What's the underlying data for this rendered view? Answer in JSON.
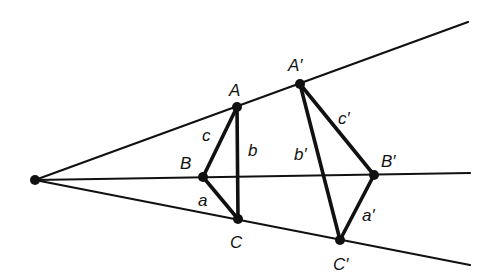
{
  "diagram": {
    "colors": {
      "ink": "#111111",
      "background": "#ffffff"
    },
    "center": {
      "x": 35,
      "y": 180
    },
    "rays": [
      {
        "name": "ray-through-A",
        "x2": 468,
        "y2": 22
      },
      {
        "name": "ray-through-B",
        "x2": 470,
        "y2": 173
      },
      {
        "name": "ray-through-C",
        "x2": 470,
        "y2": 265
      }
    ],
    "triangle_1": {
      "vertices": {
        "A": {
          "label": "A",
          "x": 237,
          "y": 107
        },
        "B": {
          "label": "B",
          "x": 203,
          "y": 177
        },
        "C": {
          "label": "C",
          "x": 238,
          "y": 219
        }
      },
      "sides": {
        "a": "a",
        "b": "b",
        "c": "c"
      }
    },
    "triangle_2": {
      "vertices": {
        "A": {
          "label": "A′",
          "x": 300,
          "y": 84
        },
        "B": {
          "label": "B′",
          "x": 374,
          "y": 175
        },
        "C": {
          "label": "C′",
          "x": 340,
          "y": 240
        }
      },
      "sides": {
        "a": "a′",
        "b": "b′",
        "c": "c′"
      }
    }
  }
}
